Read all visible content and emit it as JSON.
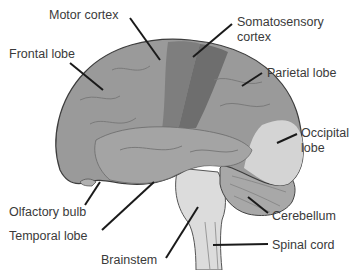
{
  "diagram": {
    "labels": {
      "motor_cortex": "Motor cortex",
      "somatosensory_cortex_1": "Somatosensory",
      "somatosensory_cortex_2": "cortex",
      "frontal_lobe": "Frontal lobe",
      "parietal_lobe": "Parietal lobe",
      "occipital_lobe_1": "Occipital",
      "occipital_lobe_2": "lobe",
      "olfactory_bulb": "Olfactory bulb",
      "cerebellum": "Cerebellum",
      "temporal_lobe": "Temporal lobe",
      "brainstem": "Brainstem",
      "spinal_cord": "Spinal cord"
    },
    "colors": {
      "cerebrum": "#9a9a9a",
      "motor_cortex": "#7e7e7e",
      "somatosensory": "#6e6e6e",
      "occipital": "#d4d4d4",
      "cerebellum": "#a8a8a8",
      "brainstem": "#dcdcdc",
      "outline": "#3c3c3c",
      "leader": "#1a1a1a",
      "text": "#3a3a3a"
    }
  }
}
